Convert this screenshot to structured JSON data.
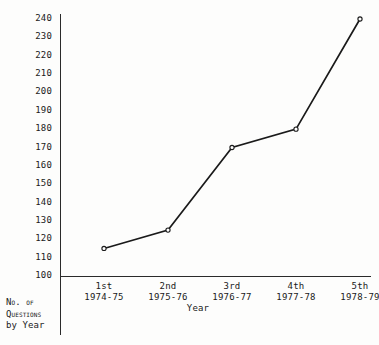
{
  "chart_data": {
    "type": "line",
    "title": "",
    "subtitle": "",
    "xlabel": "Year",
    "ylabel": "",
    "categories": [
      "1st\n1974-75",
      "2nd\n1975-76",
      "3rd\n1976-77",
      "4th\n1977-78",
      "5th\n1978-79"
    ],
    "category_parts": [
      {
        "ordinal": "1st",
        "years": "1974-75"
      },
      {
        "ordinal": "2nd",
        "years": "1975-76"
      },
      {
        "ordinal": "3rd",
        "years": "1976-77"
      },
      {
        "ordinal": "4th",
        "years": "1977-78"
      },
      {
        "ordinal": "5th",
        "years": "1978-79"
      }
    ],
    "values": [
      115,
      125,
      170,
      180,
      240
    ],
    "ylim": [
      100,
      240
    ],
    "ytick_step": 10,
    "yticks": [
      100,
      110,
      120,
      130,
      140,
      150,
      160,
      170,
      180,
      190,
      200,
      210,
      220,
      230,
      240
    ],
    "grid": false,
    "legend": null,
    "marker": "open-circle",
    "line_color": "#1a1a1a",
    "marker_face_color": "#ffffff",
    "annotations": []
  },
  "caption": {
    "line1": "No. of",
    "line2": "Questions",
    "line3": "by Year"
  }
}
